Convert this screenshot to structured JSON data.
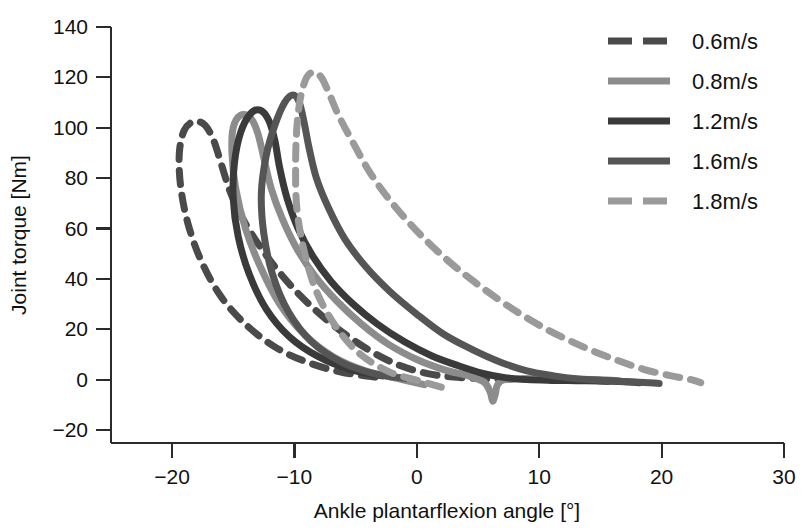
{
  "chart_data": {
    "type": "line",
    "title": "",
    "xlabel": "Ankle plantarflexion angle [°]",
    "ylabel": "Joint torque [Nm]",
    "xlim": [
      -25,
      30
    ],
    "ylim": [
      -27,
      140
    ],
    "xticks": [
      -20,
      -10,
      0,
      10,
      20,
      30
    ],
    "xtick_labels": [
      "−20",
      "−10",
      "0",
      "10",
      "20",
      "30"
    ],
    "yticks": [
      -20,
      0,
      20,
      40,
      60,
      80,
      100,
      120,
      140
    ],
    "ytick_labels": [
      "−20",
      "0",
      "20",
      "40",
      "60",
      "80",
      "100",
      "120",
      "140"
    ],
    "grid": false,
    "legend_position": "upper-right",
    "series": [
      {
        "name": "0.6m/s",
        "label": "0.6m/s",
        "color": "#4a4a4a",
        "dash": "14,11",
        "width": 7,
        "points": [
          [
            -3.4,
            1.0
          ],
          [
            -6.2,
            3.0
          ],
          [
            -9.0,
            7.0
          ],
          [
            -11.6,
            13.0
          ],
          [
            -14.0,
            22.0
          ],
          [
            -16.0,
            33.0
          ],
          [
            -17.6,
            47.0
          ],
          [
            -18.7,
            62.0
          ],
          [
            -19.3,
            77.0
          ],
          [
            -19.4,
            90.0
          ],
          [
            -19.0,
            99.0
          ],
          [
            -18.2,
            102.5
          ],
          [
            -17.3,
            101.0
          ],
          [
            -16.6,
            95.0
          ],
          [
            -16.0,
            86.0
          ],
          [
            -15.2,
            74.0
          ],
          [
            -14.0,
            62.0
          ],
          [
            -12.4,
            50.0
          ],
          [
            -10.6,
            39.0
          ],
          [
            -8.6,
            29.0
          ],
          [
            -6.4,
            20.0
          ],
          [
            -4.0,
            12.0
          ],
          [
            -1.6,
            6.0
          ],
          [
            0.8,
            2.5
          ],
          [
            3.0,
            1.0
          ],
          [
            5.2,
            0.5
          ],
          [
            7.4,
            0.3
          ],
          [
            9.6,
            0.2
          ],
          [
            11.8,
            0.0
          ],
          [
            14.0,
            -0.3
          ],
          [
            15.6,
            -0.6
          ]
        ]
      },
      {
        "name": "0.8m/s",
        "label": "0.8m/s",
        "color": "#8c8c8c",
        "dash": "none",
        "width": 7,
        "points": [
          [
            0.6,
            -2.0
          ],
          [
            -1.6,
            0.5
          ],
          [
            -4.2,
            3.5
          ],
          [
            -6.8,
            9.0
          ],
          [
            -9.2,
            18.0
          ],
          [
            -11.2,
            30.0
          ],
          [
            -12.8,
            45.0
          ],
          [
            -14.0,
            60.0
          ],
          [
            -14.8,
            76.0
          ],
          [
            -15.1,
            90.0
          ],
          [
            -15.0,
            100.0
          ],
          [
            -14.4,
            105.0
          ],
          [
            -13.6,
            104.0
          ],
          [
            -13.0,
            98.0
          ],
          [
            -12.5,
            88.0
          ],
          [
            -11.9,
            76.0
          ],
          [
            -11.0,
            64.0
          ],
          [
            -9.8,
            52.0
          ],
          [
            -8.3,
            41.0
          ],
          [
            -6.5,
            31.0
          ],
          [
            -4.5,
            22.0
          ],
          [
            -2.3,
            14.0
          ],
          [
            0.0,
            8.0
          ],
          [
            2.2,
            4.0
          ],
          [
            4.2,
            1.5
          ],
          [
            5.5,
            -1.0
          ],
          [
            6.0,
            -5.0
          ],
          [
            6.2,
            -8.5
          ],
          [
            6.4,
            -6.0
          ],
          [
            6.6,
            -2.0
          ],
          [
            7.2,
            0.0
          ],
          [
            9.0,
            0.2
          ],
          [
            11.0,
            0.3
          ],
          [
            13.0,
            0.2
          ],
          [
            15.0,
            0.0
          ],
          [
            16.5,
            -0.4
          ]
        ]
      },
      {
        "name": "1.2m/s",
        "label": "1.2m/s",
        "color": "#3a3a3a",
        "dash": "none",
        "width": 7,
        "points": [
          [
            -2.8,
            1.5
          ],
          [
            -5.4,
            4.0
          ],
          [
            -8.0,
            9.0
          ],
          [
            -10.4,
            17.0
          ],
          [
            -12.3,
            28.0
          ],
          [
            -13.7,
            42.0
          ],
          [
            -14.6,
            57.0
          ],
          [
            -15.0,
            72.0
          ],
          [
            -14.9,
            86.0
          ],
          [
            -14.4,
            98.0
          ],
          [
            -13.6,
            105.5
          ],
          [
            -12.8,
            107.0
          ],
          [
            -12.1,
            103.0
          ],
          [
            -11.6,
            95.0
          ],
          [
            -11.2,
            84.0
          ],
          [
            -10.6,
            72.0
          ],
          [
            -9.7,
            60.0
          ],
          [
            -8.5,
            49.0
          ],
          [
            -7.0,
            39.0
          ],
          [
            -5.2,
            30.0
          ],
          [
            -3.2,
            22.0
          ],
          [
            -1.0,
            15.0
          ],
          [
            1.2,
            9.5
          ],
          [
            3.4,
            5.5
          ],
          [
            5.4,
            2.5
          ],
          [
            7.2,
            0.8
          ],
          [
            9.0,
            0.0
          ],
          [
            11.0,
            -0.3
          ],
          [
            13.0,
            -0.4
          ],
          [
            15.0,
            -0.5
          ],
          [
            17.0,
            -0.8
          ],
          [
            18.2,
            -1.2
          ]
        ]
      },
      {
        "name": "1.6m/s",
        "label": "1.6m/s",
        "color": "#555555",
        "dash": "none",
        "width": 7,
        "points": [
          [
            -1.0,
            0.5
          ],
          [
            -3.6,
            2.5
          ],
          [
            -6.2,
            7.0
          ],
          [
            -8.6,
            15.0
          ],
          [
            -10.5,
            27.0
          ],
          [
            -11.8,
            42.0
          ],
          [
            -12.5,
            58.0
          ],
          [
            -12.7,
            74.0
          ],
          [
            -12.3,
            89.0
          ],
          [
            -11.6,
            101.0
          ],
          [
            -10.8,
            110.0
          ],
          [
            -10.1,
            113.0
          ],
          [
            -9.6,
            110.0
          ],
          [
            -9.2,
            102.0
          ],
          [
            -8.8,
            92.0
          ],
          [
            -8.2,
            80.0
          ],
          [
            -7.2,
            68.0
          ],
          [
            -5.9,
            56.0
          ],
          [
            -4.2,
            45.0
          ],
          [
            -2.2,
            35.0
          ],
          [
            0.0,
            26.0
          ],
          [
            2.2,
            18.0
          ],
          [
            4.5,
            12.0
          ],
          [
            6.8,
            7.0
          ],
          [
            9.0,
            3.5
          ],
          [
            11.2,
            1.5
          ],
          [
            13.2,
            0.3
          ],
          [
            15.2,
            -0.3
          ],
          [
            17.2,
            -0.8
          ],
          [
            19.0,
            -1.2
          ],
          [
            19.8,
            -1.5
          ]
        ]
      },
      {
        "name": "1.8m/s",
        "label": "1.8m/s",
        "color": "#9a9a9a",
        "dash": "14,11",
        "width": 7,
        "points": [
          [
            2.0,
            -3.0
          ],
          [
            0.2,
            -0.5
          ],
          [
            -2.2,
            3.0
          ],
          [
            -4.6,
            10.0
          ],
          [
            -6.6,
            21.0
          ],
          [
            -8.2,
            35.0
          ],
          [
            -9.2,
            51.0
          ],
          [
            -9.8,
            68.0
          ],
          [
            -9.9,
            85.0
          ],
          [
            -9.8,
            100.0
          ],
          [
            -9.5,
            112.0
          ],
          [
            -9.0,
            120.0
          ],
          [
            -8.4,
            122.0
          ],
          [
            -7.8,
            120.0
          ],
          [
            -7.2,
            114.0
          ],
          [
            -6.4,
            105.0
          ],
          [
            -5.2,
            94.0
          ],
          [
            -3.8,
            82.0
          ],
          [
            -2.0,
            70.0
          ],
          [
            0.2,
            58.0
          ],
          [
            2.6,
            47.0
          ],
          [
            5.2,
            37.0
          ],
          [
            8.0,
            27.5
          ],
          [
            10.8,
            19.5
          ],
          [
            13.6,
            13.0
          ],
          [
            16.2,
            8.0
          ],
          [
            18.6,
            4.0
          ],
          [
            20.8,
            1.5
          ],
          [
            22.4,
            0.0
          ],
          [
            23.2,
            -1.2
          ]
        ]
      }
    ]
  },
  "axes": {
    "x_axis_name": "ankle-plantarflexion-angle-axis",
    "y_axis_name": "joint-torque-axis"
  }
}
